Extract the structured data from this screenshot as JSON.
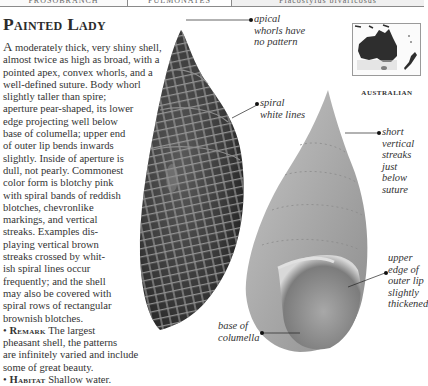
{
  "header": {
    "cells": [
      "PROSOBRANCH",
      "PULMONATES",
      "Placostylus bivaricosus"
    ]
  },
  "title": "Painted Lady",
  "body": {
    "dropcap": "A",
    "lines": [
      " moderately thick, very shiny shell,",
      "almost twice as high as broad, with a",
      "pointed apex, convex whorls, and a",
      "well-defined suture. Body whorl",
      "slightly taller than spire;",
      "aperture pear-shaped, its lower",
      "edge projecting well below",
      "base of columella; upper end",
      "of outer lip bends inwards",
      "slightly. Inside of aperture is",
      "dull, not pearly. Commonest",
      "color form is blotchy pink",
      "with spiral bands of reddish",
      "blotches, chevronlike",
      "markings, and vertical",
      "streaks. Examples dis-",
      "playing vertical brown",
      "streaks crossed by whit-",
      "ish spiral lines occur",
      "frequently; and the shell",
      "may also be covered with",
      "spiral rows of rectangular",
      "brownish blotches."
    ],
    "remark": {
      "bullet": "•",
      "heading": "Remark",
      "lines": [
        " The largest",
        "pheasant shell, the patterns",
        "are infinitely varied and include",
        "some of great beauty."
      ]
    },
    "habitat": {
      "bullet": "•",
      "heading": "Habitat",
      "text": " Shallow water."
    }
  },
  "annotations": {
    "apical": [
      "apical",
      "whorls have",
      "no pattern"
    ],
    "spiral": [
      "spiral",
      "white lines"
    ],
    "short": [
      "short",
      "vertical",
      "streaks",
      "just",
      "below",
      "suture"
    ],
    "upper": [
      "upper",
      "edge of",
      "outer lip",
      "slightly",
      "thickened"
    ],
    "base": [
      "base of",
      "columella"
    ]
  },
  "map": {
    "region_label": "AUSTRALIAN",
    "land_color": "#2e2e2e",
    "highlight_color": "#cfcfcf"
  },
  "colors": {
    "shell_dark": "#3a3a3a",
    "shell_pattern": "#9a9a9a",
    "shell_light": "#b5b5b5"
  }
}
